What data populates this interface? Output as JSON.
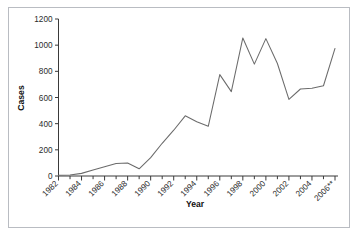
{
  "chart_data": {
    "type": "line",
    "title": "",
    "xlabel": "Year",
    "ylabel": "Cases",
    "xlim": [
      1982,
      2006
    ],
    "ylim": [
      0,
      1200
    ],
    "grid": false,
    "legend": null,
    "line_color": "#6b6b6b",
    "axis_color": "#3a3a3a",
    "frame_color": "#b9bcc2",
    "x_tick_labels": [
      "1982",
      "1984",
      "1986",
      "1988",
      "1990",
      "1992",
      "1994",
      "1996",
      "1998",
      "2000",
      "2002",
      "2004",
      "2006**"
    ],
    "x_tick_label_years": [
      1982,
      1984,
      1986,
      1988,
      1990,
      1992,
      1994,
      1996,
      1998,
      2000,
      2002,
      2004,
      2006
    ],
    "x_minor_years": [
      1983,
      1985,
      1987,
      1989,
      1991,
      1993,
      1995,
      1997,
      1999,
      2001,
      2003,
      2005
    ],
    "y_tick_labels": [
      "0",
      "200",
      "400",
      "600",
      "800",
      "1000",
      "1200"
    ],
    "y_tick_values": [
      0,
      200,
      400,
      600,
      800,
      1000,
      1200
    ],
    "x": [
      1982,
      1983,
      1984,
      1985,
      1986,
      1987,
      1988,
      1989,
      1990,
      1991,
      1992,
      1993,
      1994,
      1995,
      1996,
      1997,
      1998,
      1999,
      2000,
      2001,
      2002,
      2003,
      2004,
      2005,
      2006
    ],
    "values": [
      5,
      8,
      20,
      45,
      70,
      95,
      100,
      55,
      140,
      250,
      350,
      460,
      415,
      380,
      775,
      645,
      1055,
      855,
      1050,
      860,
      585,
      665,
      670,
      690,
      975
    ],
    "series": [
      {
        "name": "Cases",
        "values": [
          5,
          8,
          20,
          45,
          70,
          95,
          100,
          55,
          140,
          250,
          350,
          460,
          415,
          380,
          775,
          645,
          1055,
          855,
          1050,
          860,
          585,
          665,
          670,
          690,
          975
        ]
      }
    ],
    "footnote_marker": "**"
  }
}
